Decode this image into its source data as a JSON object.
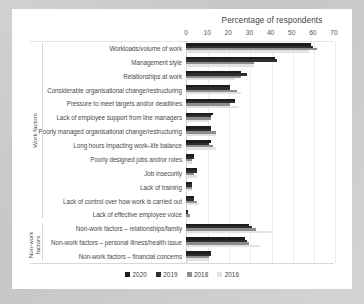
{
  "chart_data": {
    "type": "bar",
    "orientation": "horizontal",
    "title": "Percentage of respondents",
    "xlabel": "Percentage of respondents",
    "ylabel": "",
    "xlim": [
      0,
      70
    ],
    "xticks": [
      0,
      10,
      20,
      30,
      40,
      50,
      60,
      70
    ],
    "grid": true,
    "legend_position": "bottom",
    "legend": [
      "2020",
      "2019",
      "2018",
      "2016"
    ],
    "colors": {
      "2020": "#1c1c1c",
      "2019": "#2e2e2e",
      "2018": "#8d8d8d",
      "2016": "#e2e2e2"
    },
    "group_labels": [
      "Work factors",
      "Non-work factors"
    ],
    "categories": [
      "Workloads/volume of work",
      "Management style",
      "Relationships at work",
      "Considerable organisational change/restructuring",
      "Pressure to meet targets and/or deadlines",
      "Lack of employee support from line managers",
      "Poorly managed organisational change/restructuring",
      "Long hours impacting work–life balance",
      "Poorly designed jobs and/or roles",
      "Job insecurity",
      "Lack of training",
      "Lack of control over how work is carried out",
      "Lack of effective employee voice",
      "Non-work factors – relationships/family",
      "Non-work factors – personal illness/health issue",
      "Non-work factors – financial concerns"
    ],
    "series": [
      {
        "name": "2020",
        "values": [
          59,
          42,
          26,
          21,
          23,
          13,
          12,
          12,
          4,
          5,
          3,
          4,
          1,
          30,
          28,
          12
        ]
      },
      {
        "name": "2019",
        "values": [
          60,
          43,
          29,
          21,
          23,
          12,
          12,
          11,
          4,
          5,
          3,
          4,
          1,
          31,
          29,
          12
        ]
      },
      {
        "name": "2018",
        "values": [
          62,
          32,
          26,
          24,
          21,
          12,
          14,
          13,
          3,
          4,
          3,
          5,
          2,
          33,
          30,
          11
        ]
      },
      {
        "name": "2016",
        "values": [
          58,
          32,
          23,
          26,
          25,
          11,
          14,
          14,
          3,
          5,
          3,
          6,
          2,
          40,
          35,
          11
        ]
      }
    ]
  },
  "axis": {
    "tick_labels": [
      "0",
      "10",
      "20",
      "30",
      "40",
      "50",
      "60",
      "70"
    ]
  }
}
